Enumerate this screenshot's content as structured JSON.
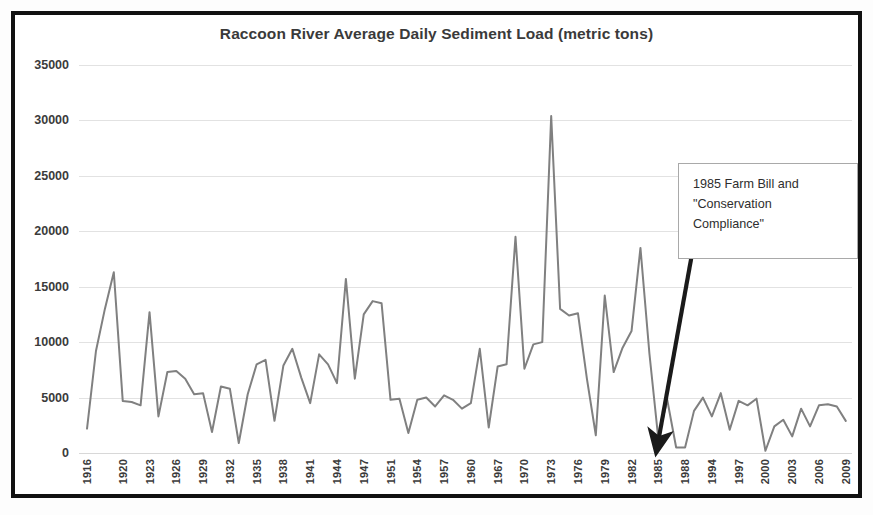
{
  "chart_data": {
    "type": "line",
    "title": "Raccoon River Average Daily Sediment Load (metric tons)",
    "xlabel": "",
    "ylabel": "",
    "ylim": [
      0,
      35000
    ],
    "ytick_step": 5000,
    "yticks": [
      "35000",
      "30000",
      "25000",
      "20000",
      "15000",
      "10000",
      "5000",
      "0"
    ],
    "grid": true,
    "legend": "none",
    "line_color": "#808080",
    "xtick_labels": [
      "1916",
      "1920",
      "1923",
      "1926",
      "1929",
      "1932",
      "1935",
      "1938",
      "1941",
      "1944",
      "1947",
      "1951",
      "1954",
      "1957",
      "1960",
      "1967",
      "1970",
      "1973",
      "1976",
      "1979",
      "1982",
      "1985",
      "1988",
      "1994",
      "1997",
      "2000",
      "2003",
      "2006",
      "2009"
    ],
    "x": [
      "1916",
      "1917",
      "1918",
      "1919",
      "1920",
      "1921",
      "1922",
      "1923",
      "1924",
      "1925",
      "1926",
      "1927",
      "1928",
      "1929",
      "1930",
      "1931",
      "1932",
      "1933",
      "1934",
      "1935",
      "1936",
      "1937",
      "1938",
      "1939",
      "1940",
      "1941",
      "1942",
      "1943",
      "1944",
      "1945",
      "1946",
      "1947",
      "1948",
      "1949",
      "1951",
      "1952",
      "1953",
      "1954",
      "1955",
      "1956",
      "1957",
      "1958",
      "1959",
      "1960",
      "1961",
      "1962",
      "1967",
      "1968",
      "1969",
      "1970",
      "1971",
      "1972",
      "1973",
      "1974",
      "1975",
      "1976",
      "1977",
      "1978",
      "1979",
      "1980",
      "1981",
      "1982",
      "1983",
      "1984",
      "1985",
      "1986",
      "1987",
      "1988",
      "1989",
      "1990",
      "1994",
      "1995",
      "1996",
      "1997",
      "1998",
      "1999",
      "2000",
      "2001",
      "2002",
      "2003",
      "2004",
      "2005",
      "2006",
      "2007",
      "2008",
      "2009"
    ],
    "values": [
      2200,
      9200,
      13000,
      16300,
      4700,
      4600,
      4300,
      12700,
      3300,
      7300,
      7400,
      6700,
      5300,
      5400,
      1900,
      6000,
      5800,
      900,
      5300,
      8000,
      8400,
      2900,
      7900,
      9400,
      6800,
      4500,
      8900,
      8000,
      6300,
      15700,
      6700,
      12500,
      13700,
      13500,
      4800,
      4900,
      1800,
      4800,
      5000,
      4200,
      5200,
      4800,
      4000,
      4500,
      9400,
      2300,
      7800,
      8000,
      19500,
      7600,
      9800,
      10000,
      30400,
      13000,
      12400,
      12600,
      6700,
      1600,
      14200,
      7300,
      9500,
      11000,
      18500,
      9000,
      1300,
      4800,
      500,
      500,
      3800,
      5000,
      3300,
      5400,
      2100,
      4700,
      4300,
      4900,
      200,
      2400,
      3000,
      1500,
      4000,
      2400,
      4300,
      4400,
      4200,
      2900
    ],
    "annotation": {
      "lines": [
        "1985 Farm Bill and",
        "\"Conservation",
        "Compliance\""
      ],
      "points_to_year": "1985",
      "arrow_color": "#1a1a1a"
    }
  }
}
